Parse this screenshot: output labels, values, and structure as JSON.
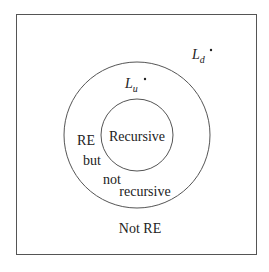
{
  "diagram": {
    "title": "",
    "colors": {
      "stroke": "#555555",
      "text": "#222222",
      "background": "#ffffff"
    },
    "regions": {
      "universe_label": "Not RE",
      "outer_circle_label_lines": [
        "RE",
        "but",
        "not",
        "recursive"
      ],
      "inner_circle_label": "Recursive"
    },
    "points": [
      {
        "symbol": "L",
        "subscript": "u",
        "region": "RE but not recursive"
      },
      {
        "symbol": "L",
        "subscript": "d",
        "region": "Not RE"
      }
    ]
  }
}
